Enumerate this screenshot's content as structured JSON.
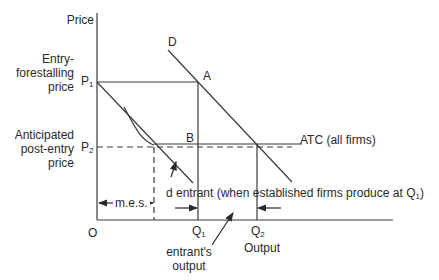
{
  "diagram": {
    "type": "economics-limit-pricing",
    "axes": {
      "y_label": "Price",
      "x_label": "Output",
      "origin_label": "O"
    },
    "price_levels": [
      {
        "id": "P1",
        "symbol": "P",
        "sub": "1",
        "label_lines": [
          "Entry-",
          "forestalling",
          "price"
        ]
      },
      {
        "id": "P2",
        "symbol": "P",
        "sub": "2",
        "label_lines": [
          "Anticipated",
          "post-entry",
          "price"
        ]
      }
    ],
    "quantities": [
      {
        "id": "Q1",
        "symbol": "Q",
        "sub": "1"
      },
      {
        "id": "Q2",
        "symbol": "Q",
        "sub": "2"
      }
    ],
    "points": [
      {
        "id": "A",
        "label": "A"
      },
      {
        "id": "B",
        "label": "B"
      }
    ],
    "curves": {
      "market_demand": {
        "label": "D"
      },
      "average_cost": {
        "label": "ATC (all firms)"
      },
      "entrant_demand": {
        "label_prefix": "d entrant (when established firms produce at Q",
        "label_sub": "1",
        "label_suffix": ")"
      }
    },
    "annotations": {
      "mes": "m.e.s.",
      "entrant_output_lines": [
        "entrant's",
        "output"
      ]
    },
    "colors": {
      "line": "#3a3a3a",
      "text": "#2a2a2a",
      "background": "#ffffff"
    }
  }
}
